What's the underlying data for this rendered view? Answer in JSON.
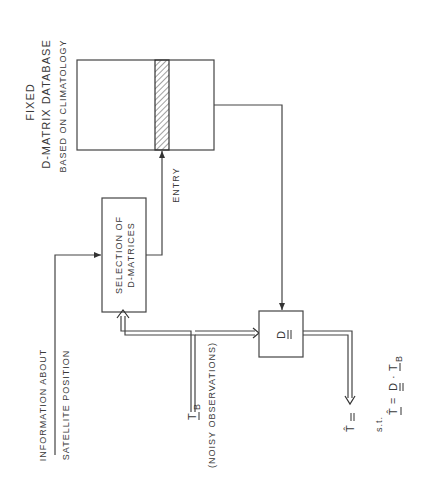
{
  "database": {
    "title_line1": "FIXED",
    "title_line2": "D-MATRIX DATABASE",
    "subtitle": "BASED ON CLIMATOLOGY",
    "entry_label": "ENTRY"
  },
  "selection_box": {
    "line1": "SELECTION OF",
    "line2": "D-MATRICES"
  },
  "satellite_info": {
    "line1": "INFORMATION ABOUT",
    "line2": "SATELLITE POSITION"
  },
  "observations": {
    "symbol": "T",
    "subscript": "B",
    "label": "(NOISY OBSERVATIONS)"
  },
  "d_box": {
    "symbol": "D"
  },
  "output": {
    "symbol": "T̂",
    "st": "s.t.",
    "formula_lhs": "T̂",
    "formula_eq": "=",
    "formula_d": "D",
    "formula_dot": "·",
    "formula_t": "T",
    "formula_sub": "B"
  }
}
